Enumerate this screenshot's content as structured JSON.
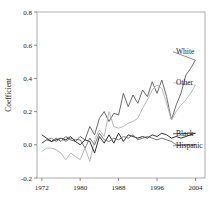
{
  "chart_data": {
    "type": "line",
    "title": "",
    "xlabel": "",
    "ylabel": "Coefficient",
    "xlim": [
      1971,
      2006
    ],
    "ylim": [
      -0.2,
      0.8
    ],
    "grid": false,
    "legend_position": "right-inline-labels",
    "xticks": [
      1972,
      1980,
      1988,
      1996,
      2004
    ],
    "xtick_labels": [
      "1972",
      "1980",
      "1988",
      "1996",
      "2004"
    ],
    "yticks": [
      -0.2,
      0.0,
      0.2,
      0.4,
      0.6,
      0.8
    ],
    "ytick_labels": [
      "-0.2",
      "0.0",
      "0.2",
      "0.4",
      "0.6",
      "0.8"
    ],
    "x": [
      1972,
      1973,
      1974,
      1975,
      1976,
      1977,
      1978,
      1979,
      1980,
      1981,
      1982,
      1983,
      1984,
      1985,
      1986,
      1987,
      1988,
      1989,
      1990,
      1991,
      1992,
      1993,
      1994,
      1995,
      1996,
      1997,
      1998,
      1999,
      2000,
      2001,
      2002,
      2003,
      2004
    ],
    "series": [
      {
        "name": "White",
        "color": "#5a5a5a",
        "label": "White",
        "values": [
          0.01,
          0.03,
          0.02,
          0.04,
          0.02,
          0.05,
          0.03,
          0.02,
          0.05,
          0.03,
          0.11,
          0.06,
          0.16,
          0.2,
          0.14,
          0.19,
          0.18,
          0.31,
          0.23,
          0.3,
          0.25,
          0.33,
          0.29,
          0.38,
          0.31,
          0.39,
          0.29,
          0.15,
          0.24,
          0.31,
          0.42,
          0.46,
          0.51
        ]
      },
      {
        "name": "Other",
        "color": "#b0b0b0",
        "label": "Other",
        "values": [
          -0.04,
          -0.02,
          -0.02,
          -0.03,
          -0.05,
          -0.09,
          -0.05,
          -0.07,
          -0.09,
          -0.02,
          -0.1,
          0.03,
          0.09,
          0.05,
          0.2,
          0.11,
          0.1,
          0.11,
          0.13,
          0.14,
          0.16,
          0.22,
          0.27,
          0.33,
          0.36,
          0.34,
          0.25,
          0.15,
          0.2,
          0.24,
          0.27,
          0.31,
          0.36
        ]
      },
      {
        "name": "Black",
        "color": "#1a1a1a",
        "label": "Black",
        "values": [
          0.06,
          0.04,
          0.02,
          0.03,
          0.04,
          0.03,
          0.05,
          0.02,
          0.0,
          0.03,
          0.02,
          -0.05,
          0.05,
          0.01,
          0.06,
          0.01,
          0.07,
          0.02,
          0.06,
          0.05,
          0.04,
          0.05,
          0.04,
          0.06,
          0.05,
          0.07,
          0.06,
          0.04,
          0.05,
          0.04,
          0.05,
          0.06,
          0.07
        ]
      },
      {
        "name": "Hispanic",
        "color": "#6a6a6a",
        "label": "Hispanic",
        "values": [
          0.01,
          0.03,
          0.04,
          0.02,
          0.04,
          0.02,
          0.04,
          0.03,
          0.03,
          -0.02,
          0.04,
          0.0,
          0.07,
          0.03,
          0.02,
          0.04,
          0.03,
          0.05,
          0.04,
          0.06,
          0.03,
          0.04,
          0.05,
          0.04,
          0.03,
          0.04,
          0.03,
          0.02,
          0.0,
          0.0,
          0.0,
          0.0,
          0.0
        ]
      }
    ]
  }
}
